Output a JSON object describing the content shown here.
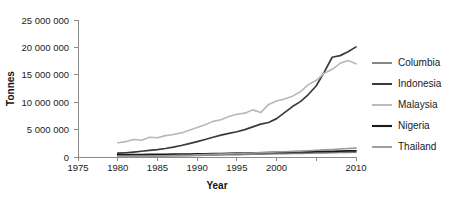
{
  "chart_data": {
    "type": "line",
    "title": "",
    "xlabel": "Year",
    "ylabel": "Tonnes",
    "xlim": [
      1975,
      2010
    ],
    "ylim": [
      0,
      25000000
    ],
    "grid": false,
    "legend_position": "right",
    "x_ticks": [
      1975,
      1980,
      1985,
      1990,
      1995,
      2000,
      2005,
      2010
    ],
    "x_tick_labels": [
      "1975",
      "1980",
      "1985",
      "1990",
      "1995",
      "2000",
      "",
      "2010"
    ],
    "y_ticks": [
      0,
      5000000,
      10000000,
      15000000,
      20000000,
      25000000
    ],
    "y_tick_labels": [
      "0",
      "5 000 000",
      "10 000 000",
      "15 000 000",
      "20 000 000",
      "25 000 000"
    ],
    "x": [
      1980,
      1981,
      1982,
      1983,
      1984,
      1985,
      1986,
      1987,
      1988,
      1989,
      1990,
      1991,
      1992,
      1993,
      1994,
      1995,
      1996,
      1997,
      1998,
      1999,
      2000,
      2001,
      2002,
      2003,
      2004,
      2005,
      2006,
      2007,
      2008,
      2009,
      2010
    ],
    "series": [
      {
        "name": "Columbia",
        "color": "#808080",
        "width": 1.6,
        "values": [
          120000,
          130000,
          140000,
          150000,
          165000,
          180000,
          195000,
          215000,
          235000,
          260000,
          285000,
          310000,
          340000,
          370000,
          400000,
          430000,
          460000,
          490000,
          520000,
          550000,
          580000,
          610000,
          640000,
          670000,
          700000,
          730000,
          760000,
          790000,
          820000,
          850000,
          880000
        ]
      },
      {
        "name": "Indonesia",
        "color": "#3a3a3a",
        "width": 1.7,
        "values": [
          690000,
          780000,
          900000,
          1050000,
          1200000,
          1350000,
          1550000,
          1800000,
          2100000,
          2450000,
          2800000,
          3200000,
          3600000,
          4000000,
          4300000,
          4600000,
          5000000,
          5500000,
          6000000,
          6300000,
          7000000,
          8100000,
          9200000,
          10100000,
          11400000,
          13000000,
          15500000,
          18200000,
          18500000,
          19200000,
          20100000
        ]
      },
      {
        "name": "Malaysia",
        "color": "#b8b8b8",
        "width": 1.6,
        "values": [
          2600000,
          2800000,
          3200000,
          3050000,
          3600000,
          3500000,
          3900000,
          4100000,
          4400000,
          4900000,
          5400000,
          5900000,
          6500000,
          6800000,
          7400000,
          7800000,
          8000000,
          8600000,
          8100000,
          9600000,
          10200000,
          10600000,
          11100000,
          11900000,
          13200000,
          14000000,
          15300000,
          16000000,
          17100000,
          17600000,
          17000000
        ]
      },
      {
        "name": "Nigeria",
        "color": "#1a1a1a",
        "width": 1.8,
        "values": [
          420000,
          430000,
          440000,
          450000,
          460000,
          470000,
          480000,
          500000,
          520000,
          540000,
          560000,
          580000,
          600000,
          620000,
          650000,
          680000,
          710000,
          740000,
          770000,
          800000,
          830000,
          860000,
          890000,
          920000,
          950000,
          980000,
          1010000,
          1040000,
          1070000,
          1100000,
          1130000
        ]
      },
      {
        "name": "Thailand",
        "color": "#9a9a9a",
        "width": 1.6,
        "values": [
          80000,
          95000,
          110000,
          130000,
          155000,
          185000,
          215000,
          250000,
          290000,
          330000,
          380000,
          430000,
          480000,
          530000,
          580000,
          630000,
          680000,
          730000,
          790000,
          850000,
          900000,
          960000,
          1020000,
          1080000,
          1150000,
          1220000,
          1300000,
          1380000,
          1460000,
          1540000,
          1620000
        ]
      }
    ]
  },
  "legend": {
    "items": [
      {
        "label": "Columbia"
      },
      {
        "label": "Indonesia"
      },
      {
        "label": "Malaysia"
      },
      {
        "label": "Nigeria"
      },
      {
        "label": "Thailand"
      }
    ]
  }
}
